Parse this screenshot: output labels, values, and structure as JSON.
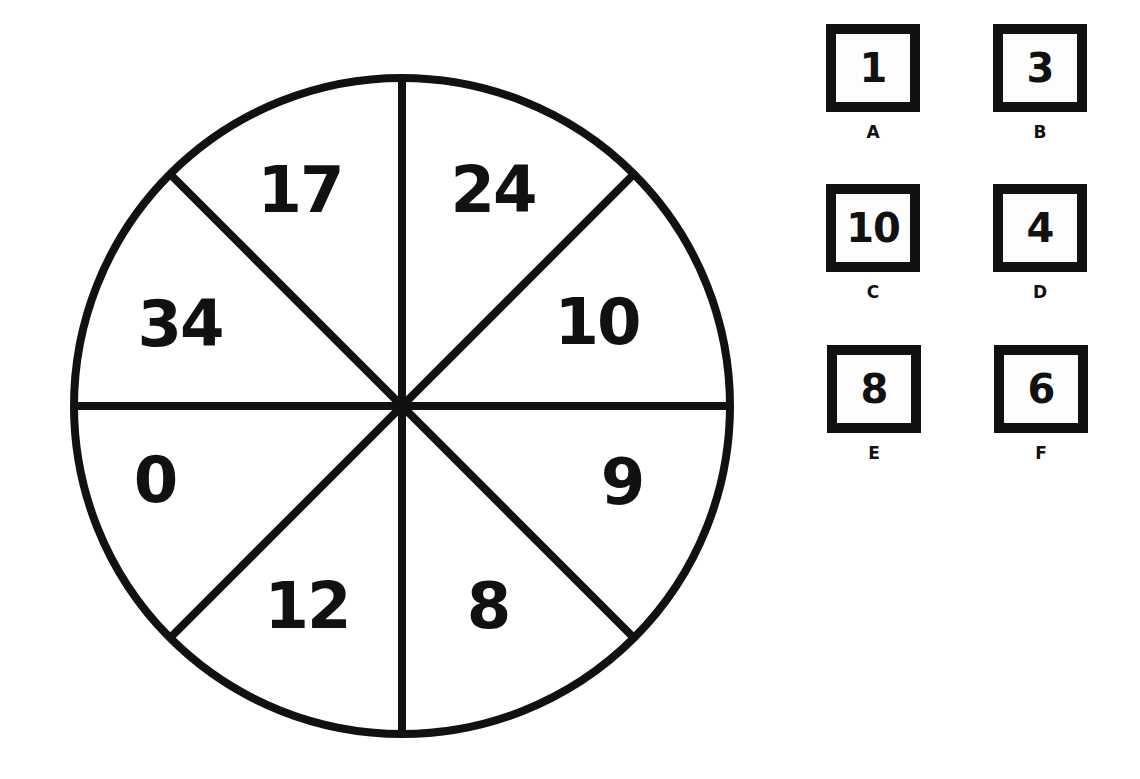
{
  "puzzle": {
    "wheel": {
      "segments": [
        {
          "position": "top-left-upper",
          "value": "17"
        },
        {
          "position": "top-right-upper",
          "value": "24"
        },
        {
          "position": "right-upper",
          "value": "10"
        },
        {
          "position": "right-lower",
          "value": "9"
        },
        {
          "position": "bottom-right",
          "value": "8"
        },
        {
          "position": "bottom-left",
          "value": "12"
        },
        {
          "position": "left-lower",
          "value": "0"
        },
        {
          "position": "left-upper",
          "value": "34"
        }
      ]
    },
    "options": [
      {
        "label": "A",
        "value": "1"
      },
      {
        "label": "B",
        "value": "3"
      },
      {
        "label": "C",
        "value": "10"
      },
      {
        "label": "D",
        "value": "4"
      },
      {
        "label": "E",
        "value": "8"
      },
      {
        "label": "F",
        "value": "6"
      }
    ]
  },
  "colors": {
    "ink": "#111111",
    "background": "#ffffff"
  }
}
